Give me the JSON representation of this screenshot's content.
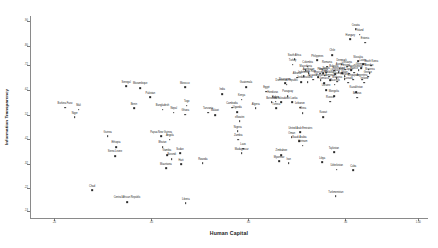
{
  "chart_data": {
    "type": "scatter",
    "title": "",
    "xlabel": "Human Capital",
    "ylabel": "Information Transparency",
    "xlim": [
      0.2,
      1.02
    ],
    "ylim": [
      0.1,
      0.92
    ],
    "grid": false,
    "legend": null,
    "xticks": [
      {
        "value": 0.25,
        "label": ".25"
      },
      {
        "value": 0.45,
        "label": ".45"
      },
      {
        "value": 0.65,
        "label": ".65"
      },
      {
        "value": 0.85,
        "label": ".85"
      },
      {
        "value": 1.0,
        "label": "1.00"
      }
    ],
    "yticks": [
      {
        "value": 0.9,
        "label": ".90"
      },
      {
        "value": 0.8,
        "label": ".80"
      },
      {
        "value": 0.72,
        "label": ".72"
      },
      {
        "value": 0.62,
        "label": ".62"
      },
      {
        "value": 0.52,
        "label": ".52"
      },
      {
        "value": 0.42,
        "label": ".42"
      },
      {
        "value": 0.32,
        "label": ".32"
      },
      {
        "value": 0.22,
        "label": ".22"
      },
      {
        "value": 0.13,
        "label": ".13"
      }
    ],
    "points": [
      {
        "label": "Burkina Faso",
        "x": 0.272,
        "y": 0.548
      },
      {
        "label": "Mali",
        "x": 0.3,
        "y": 0.54
      },
      {
        "label": "Niger",
        "x": 0.292,
        "y": 0.508
      },
      {
        "label": "Guinea",
        "x": 0.36,
        "y": 0.432
      },
      {
        "label": "Ethiopia",
        "x": 0.377,
        "y": 0.388
      },
      {
        "label": "Sierra Leone",
        "x": 0.375,
        "y": 0.352
      },
      {
        "label": "Chad",
        "x": 0.328,
        "y": 0.212
      },
      {
        "label": "Central African Republic",
        "x": 0.4,
        "y": 0.165
      },
      {
        "label": "Senegal",
        "x": 0.398,
        "y": 0.634
      },
      {
        "label": "Mozambique",
        "x": 0.427,
        "y": 0.628
      },
      {
        "label": "Benin",
        "x": 0.414,
        "y": 0.545
      },
      {
        "label": "Pakistan",
        "x": 0.448,
        "y": 0.59
      },
      {
        "label": "Bangladesh",
        "x": 0.473,
        "y": 0.54
      },
      {
        "label": "Papua New Guinea",
        "x": 0.47,
        "y": 0.432
      },
      {
        "label": "Angola",
        "x": 0.488,
        "y": 0.418
      },
      {
        "label": "Bhutan",
        "x": 0.473,
        "y": 0.388
      },
      {
        "label": "Gambia",
        "x": 0.482,
        "y": 0.356
      },
      {
        "label": "Burundi",
        "x": 0.492,
        "y": 0.34
      },
      {
        "label": "Sudan",
        "x": 0.509,
        "y": 0.362
      },
      {
        "label": "Mauritania",
        "x": 0.48,
        "y": 0.302
      },
      {
        "label": "Haiti",
        "x": 0.511,
        "y": 0.318
      },
      {
        "label": "Nepal",
        "x": 0.496,
        "y": 0.528
      },
      {
        "label": "Ghana",
        "x": 0.52,
        "y": 0.52
      },
      {
        "label": "Togo",
        "x": 0.523,
        "y": 0.556
      },
      {
        "label": "Morocco",
        "x": 0.519,
        "y": 0.63
      },
      {
        "label": "Liberia",
        "x": 0.521,
        "y": 0.16
      },
      {
        "label": "Rwanda",
        "x": 0.556,
        "y": 0.322
      },
      {
        "label": "Tanzania",
        "x": 0.567,
        "y": 0.528
      },
      {
        "label": "Malawi",
        "x": 0.581,
        "y": 0.518
      },
      {
        "label": "India",
        "x": 0.596,
        "y": 0.604
      },
      {
        "label": "Cambodia",
        "x": 0.616,
        "y": 0.548
      },
      {
        "label": "Uganda",
        "x": 0.627,
        "y": 0.53
      },
      {
        "label": "Kenya",
        "x": 0.636,
        "y": 0.58
      },
      {
        "label": "Guatemala",
        "x": 0.645,
        "y": 0.632
      },
      {
        "label": "eSwatini",
        "x": 0.632,
        "y": 0.492
      },
      {
        "label": "Nigeria",
        "x": 0.628,
        "y": 0.452
      },
      {
        "label": "Zambia",
        "x": 0.629,
        "y": 0.418
      },
      {
        "label": "Laos",
        "x": 0.639,
        "y": 0.382
      },
      {
        "label": "Madagascar",
        "x": 0.636,
        "y": 0.362
      },
      {
        "label": "Algeria",
        "x": 0.665,
        "y": 0.546
      },
      {
        "label": "Egypt",
        "x": 0.687,
        "y": 0.613
      },
      {
        "label": "Tunisia",
        "x": 0.707,
        "y": 0.546
      },
      {
        "label": "Honduras",
        "x": 0.7,
        "y": 0.592
      },
      {
        "label": "Bolivia",
        "x": 0.706,
        "y": 0.572
      },
      {
        "label": "Botswana",
        "x": 0.698,
        "y": 0.57
      },
      {
        "label": "El Salvador",
        "x": 0.717,
        "y": 0.57
      },
      {
        "label": "Dominican Republic",
        "x": 0.729,
        "y": 0.641
      },
      {
        "label": "Nicaragua",
        "x": 0.725,
        "y": 0.646
      },
      {
        "label": "Paraguay",
        "x": 0.731,
        "y": 0.596
      },
      {
        "label": "Sri Lanka",
        "x": 0.74,
        "y": 0.57
      },
      {
        "label": "Zimbabwe",
        "x": 0.718,
        "y": 0.356
      },
      {
        "label": "Myanmar",
        "x": 0.713,
        "y": 0.33
      },
      {
        "label": "Iran",
        "x": 0.733,
        "y": 0.322
      },
      {
        "label": "Oman",
        "x": 0.739,
        "y": 0.428
      },
      {
        "label": "United Arab Emirates",
        "x": 0.757,
        "y": 0.448
      },
      {
        "label": "Saudi Arabia",
        "x": 0.755,
        "y": 0.412
      },
      {
        "label": "Vietnam",
        "x": 0.762,
        "y": 0.394
      },
      {
        "label": "Lebanon",
        "x": 0.756,
        "y": 0.548
      },
      {
        "label": "China",
        "x": 0.762,
        "y": 0.526
      },
      {
        "label": "Albania",
        "x": 0.75,
        "y": 0.67
      },
      {
        "label": "Indonesia",
        "x": 0.764,
        "y": 0.676
      },
      {
        "label": "Jordan",
        "x": 0.758,
        "y": 0.652
      },
      {
        "label": "Thailand",
        "x": 0.772,
        "y": 0.652
      },
      {
        "label": "Ecuador",
        "x": 0.783,
        "y": 0.662
      },
      {
        "label": "Colombia",
        "x": 0.772,
        "y": 0.714
      },
      {
        "label": "Macedonia",
        "x": 0.768,
        "y": 0.7
      },
      {
        "label": "Azerbaijan",
        "x": 0.774,
        "y": 0.688
      },
      {
        "label": "Costa Rica",
        "x": 0.776,
        "y": 0.678
      },
      {
        "label": "South Africa",
        "x": 0.745,
        "y": 0.744
      },
      {
        "label": "Turkey",
        "x": 0.741,
        "y": 0.722
      },
      {
        "label": "Philippines",
        "x": 0.792,
        "y": 0.74
      },
      {
        "label": "Peru",
        "x": 0.798,
        "y": 0.686
      },
      {
        "label": "Mexico",
        "x": 0.793,
        "y": 0.672
      },
      {
        "label": "Panama",
        "x": 0.799,
        "y": 0.66
      },
      {
        "label": "Georgia",
        "x": 0.804,
        "y": 0.688
      },
      {
        "label": "Brazil",
        "x": 0.807,
        "y": 0.678
      },
      {
        "label": "Jamaica",
        "x": 0.806,
        "y": 0.648
      },
      {
        "label": "Romania",
        "x": 0.812,
        "y": 0.714
      },
      {
        "label": "Serbia",
        "x": 0.81,
        "y": 0.69
      },
      {
        "label": "Moldova",
        "x": 0.817,
        "y": 0.674
      },
      {
        "label": "Armenia",
        "x": 0.818,
        "y": 0.66
      },
      {
        "label": "Chile",
        "x": 0.823,
        "y": 0.762
      },
      {
        "label": "Bulgaria",
        "x": 0.826,
        "y": 0.698
      },
      {
        "label": "Uruguay",
        "x": 0.829,
        "y": 0.684
      },
      {
        "label": "Croatia",
        "x": 0.832,
        "y": 0.668
      },
      {
        "label": "Malaysia",
        "x": 0.833,
        "y": 0.654
      },
      {
        "label": "Mauritius",
        "x": 0.828,
        "y": 0.641
      },
      {
        "label": "Ukraine",
        "x": 0.81,
        "y": 0.62
      },
      {
        "label": "Mongolia",
        "x": 0.826,
        "y": 0.596
      },
      {
        "label": "Russia",
        "x": 0.818,
        "y": 0.572
      },
      {
        "label": "Kuwait",
        "x": 0.804,
        "y": 0.51
      },
      {
        "label": "Tajikistan",
        "x": 0.826,
        "y": 0.366
      },
      {
        "label": "Libya",
        "x": 0.802,
        "y": 0.326
      },
      {
        "label": "Uzbekistan",
        "x": 0.832,
        "y": 0.296
      },
      {
        "label": "Turkmenistan",
        "x": 0.83,
        "y": 0.188
      },
      {
        "label": "Cuba",
        "x": 0.866,
        "y": 0.294
      },
      {
        "label": "Kazakhstan",
        "x": 0.872,
        "y": 0.612
      },
      {
        "label": "Belarus",
        "x": 0.874,
        "y": 0.588
      },
      {
        "label": "Hungary",
        "x": 0.86,
        "y": 0.826
      },
      {
        "label": "Croatia ",
        "x": 0.871,
        "y": 0.866
      },
      {
        "label": "Poland",
        "x": 0.879,
        "y": 0.844
      },
      {
        "label": "Estonia",
        "x": 0.89,
        "y": 0.812
      },
      {
        "label": "Latvia",
        "x": 0.886,
        "y": 0.724
      },
      {
        "label": "Slovakia",
        "x": 0.876,
        "y": 0.736
      },
      {
        "label": "South Korea",
        "x": 0.903,
        "y": 0.718
      },
      {
        "label": "Sweden",
        "x": 0.898,
        "y": 0.702
      },
      {
        "label": "Slovenia",
        "x": 0.9,
        "y": 0.688
      },
      {
        "label": "Greece",
        "x": 0.896,
        "y": 0.674
      },
      {
        "label": "Singapore",
        "x": 0.866,
        "y": 0.662
      },
      {
        "label": "Argentina",
        "x": 0.884,
        "y": 0.662
      },
      {
        "label": "Ireland",
        "x": 0.889,
        "y": 0.65
      },
      {
        "label": "Canada",
        "x": 0.856,
        "y": 0.65
      },
      {
        "label": "Finland",
        "x": 0.848,
        "y": 0.664
      },
      {
        "label": "Spain",
        "x": 0.848,
        "y": 0.676
      },
      {
        "label": "Italy",
        "x": 0.843,
        "y": 0.688
      },
      {
        "label": "Portugal",
        "x": 0.85,
        "y": 0.702
      },
      {
        "label": "Lithuania",
        "x": 0.853,
        "y": 0.714
      },
      {
        "label": "Israel",
        "x": 0.862,
        "y": 0.7
      },
      {
        "label": "Japan",
        "x": 0.858,
        "y": 0.686
      },
      {
        "label": "France",
        "x": 0.868,
        "y": 0.69
      },
      {
        "label": "Norway",
        "x": 0.877,
        "y": 0.7
      },
      {
        "label": "Germany",
        "x": 0.882,
        "y": 0.708
      },
      {
        "label": "Denmark",
        "x": 0.842,
        "y": 0.722
      },
      {
        "label": "Austria",
        "x": 0.838,
        "y": 0.706
      },
      {
        "label": "Switzerland",
        "x": 0.836,
        "y": 0.692
      }
    ]
  }
}
